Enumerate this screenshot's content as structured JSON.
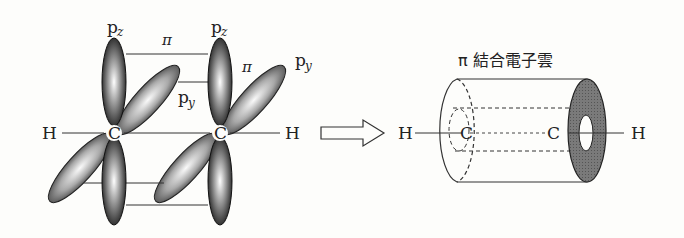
{
  "left_diagram": {
    "atoms": {
      "h_left": "H",
      "c_left": "C",
      "c_right": "C",
      "h_right": "H"
    },
    "orbital_labels": {
      "pz_left": {
        "base": "p",
        "sub": "z"
      },
      "pz_right": {
        "base": "p",
        "sub": "z"
      },
      "py_middle": {
        "base": "p",
        "sub": "y"
      },
      "py_right": {
        "base": "p",
        "sub": "y"
      }
    },
    "bond_labels": {
      "pi_top": "π",
      "pi_right": "π"
    }
  },
  "arrow": {
    "icon": "hollow-right-arrow-icon"
  },
  "right_diagram": {
    "title": "π 結合電子雲",
    "atoms": {
      "h_left": "H",
      "c_left": "C",
      "c_right": "C",
      "h_right": "H"
    }
  },
  "colors": {
    "line": "#333333",
    "lobe_dark": "#2a2a2a",
    "lobe_light": "#f4f4f4",
    "ring_fill": "#777777",
    "background": "#fdfdfb"
  }
}
